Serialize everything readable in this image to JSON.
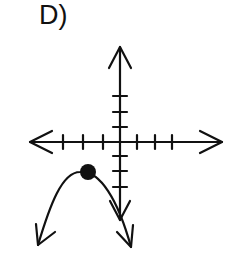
{
  "option_label": "D)",
  "graph": {
    "description": "Downward-opening parabola with closed vertex dot in quadrant III near the x-axis, on a coordinate grid",
    "axes": {
      "x_ticks_left": 3,
      "x_ticks_right": 3,
      "y_ticks_up": 3,
      "y_ticks_down": 3
    },
    "vertex": {
      "x": -2,
      "y": -2,
      "marker": "closed-dot"
    },
    "curve": "parabola opening downward with arrows at both ends",
    "colors": {
      "stroke": "#111111",
      "background": "#ffffff"
    }
  }
}
